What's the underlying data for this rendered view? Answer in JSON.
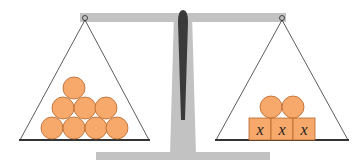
{
  "diagram": {
    "type": "balance-scale",
    "left_pan": {
      "items": [
        {
          "kind": "ball",
          "count": 8
        }
      ],
      "arrangement": "pyramid 4-3-1"
    },
    "right_pan": {
      "items": [
        {
          "kind": "ball",
          "count": 2
        },
        {
          "kind": "box",
          "count": 3,
          "label": "x"
        }
      ]
    },
    "box_labels": [
      "x",
      "x",
      "x"
    ],
    "colors": {
      "ball": "#f7a96b",
      "ball_stroke": "#b5652a",
      "beam": "#bdbdbd",
      "pivot": "#333333",
      "line": "#333333"
    }
  }
}
